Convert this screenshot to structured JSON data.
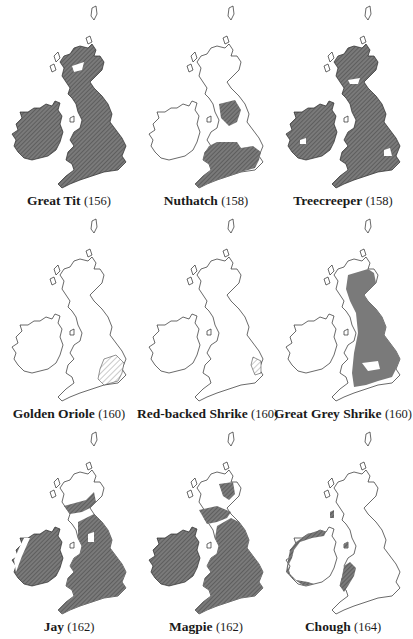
{
  "figure": {
    "style": {
      "fill_color": "#6e6e6e",
      "hatch_color": "#4a4a4a",
      "outline_color": "#2a2a2a",
      "background": "#ffffff",
      "label_color": "#1a1a1a"
    },
    "maps": [
      {
        "species": "Great Tit",
        "page": "(156)",
        "coverage": "almost all of Britain and Ireland except Scottish Highlands patches and northern isles"
      },
      {
        "species": "Nuthatch",
        "page": "(158)",
        "coverage": "England and Wales south of northern England, excluding East Anglia fens"
      },
      {
        "species": "Treecreeper",
        "page": "(158)",
        "coverage": "most of Britain and Ireland with small gaps"
      },
      {
        "species": "Golden Oriole",
        "page": "(160)",
        "coverage": "light hatching over East Anglia and south-east England"
      },
      {
        "species": "Red-backed Shrike",
        "page": "(160)",
        "coverage": "light hatching over East Anglia"
      },
      {
        "species": "Great Grey Shrike",
        "page": "(160)",
        "coverage": "eastern Britain from Scotland to south England, excluding Ireland"
      },
      {
        "species": "Jay",
        "page": "(162)",
        "coverage": "most of England, Wales, Ireland and central Scotland"
      },
      {
        "species": "Magpie",
        "page": "(162)",
        "coverage": "Ireland, England, Wales and parts of Scotland"
      },
      {
        "species": "Chough",
        "page": "(164)",
        "coverage": "western coasts of Ireland, Wales, Isle of Man and Islay"
      }
    ]
  }
}
